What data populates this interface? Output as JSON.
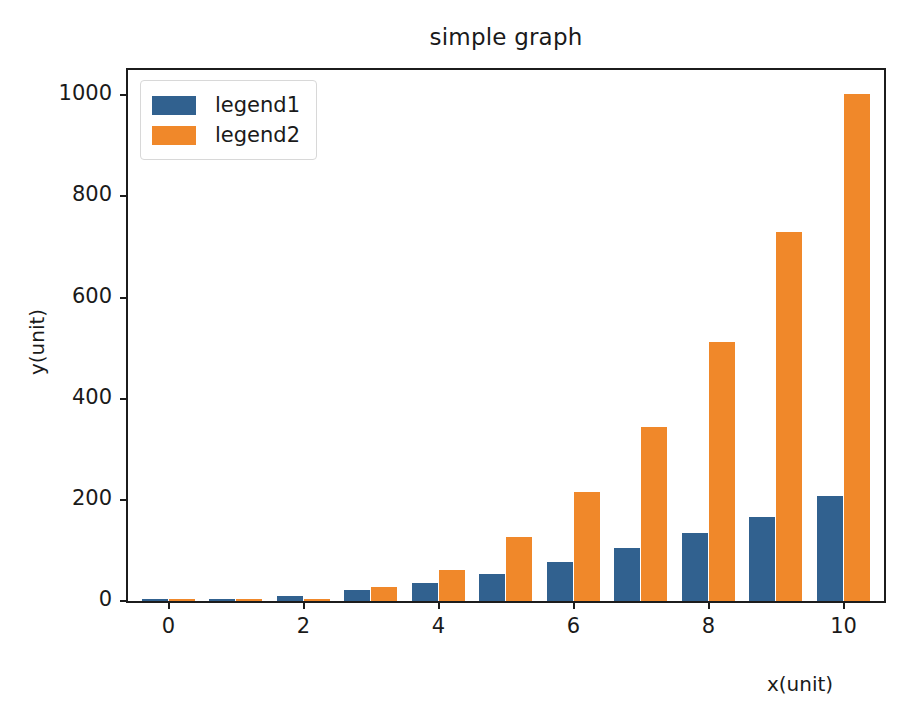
{
  "chart_data": {
    "type": "bar",
    "title": "simple graph",
    "xlabel": "x(unit)",
    "ylabel": "y(unit)",
    "grid": false,
    "legend_position": "upper left",
    "categories": [
      0,
      1,
      2,
      3,
      4,
      5,
      6,
      7,
      8,
      9,
      10
    ],
    "x": [
      0,
      1,
      2,
      3,
      4,
      5,
      6,
      7,
      8,
      9,
      10
    ],
    "xlim": [
      -0.6,
      10.6
    ],
    "ylim": [
      0,
      1050
    ],
    "xticks": [
      "0",
      "2",
      "4",
      "6",
      "8",
      "10"
    ],
    "xtick_values": [
      0,
      2,
      4,
      6,
      8,
      10
    ],
    "yticks": [
      "0",
      "200",
      "400",
      "600",
      "800",
      "1000"
    ],
    "ytick_values": [
      0,
      200,
      400,
      600,
      800,
      1000
    ],
    "series": [
      {
        "name": "legend1",
        "color": "#31618f",
        "values": [
          0,
          2,
          10,
          21,
          35,
          53,
          78,
          104,
          134,
          167,
          207
        ]
      },
      {
        "name": "legend2",
        "color": "#f0882a",
        "values": [
          0,
          1,
          4,
          27,
          62,
          127,
          216,
          344,
          512,
          730,
          1002
        ]
      }
    ]
  },
  "legend": {
    "entries": [
      {
        "label": "legend1"
      },
      {
        "label": "legend2"
      }
    ]
  },
  "colors": {
    "series1": "#31618f",
    "series2": "#f0882a",
    "axis": "#1c1c1c",
    "text": "#1a1a1a",
    "background": "#ffffff"
  }
}
